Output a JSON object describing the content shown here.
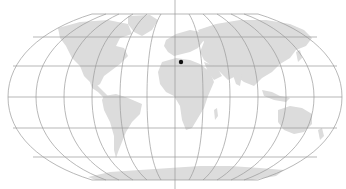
{
  "map": {
    "projection": "Robinson",
    "background": "#ffffff",
    "land_color": "#dcdcdc",
    "graticule_color": "#9a9a9a",
    "graticule_spacing_deg": 30,
    "marker": {
      "label": "location-marker",
      "lon": 9,
      "lat": 34,
      "color": "#111111"
    }
  }
}
